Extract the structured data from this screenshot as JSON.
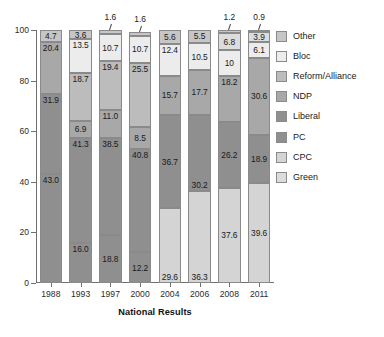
{
  "chart_data": {
    "type": "bar",
    "stacked": true,
    "title": "",
    "xlabel": "National Results",
    "ylabel": "",
    "ylim": [
      0,
      100
    ],
    "yticks": [
      0,
      20,
      40,
      60,
      80,
      100
    ],
    "grid": false,
    "legend_position": "right",
    "categories": [
      "1988",
      "1993",
      "1997",
      "2000",
      "2004",
      "2006",
      "2008",
      "2011"
    ],
    "series": [
      {
        "name": "PC",
        "color": "#8f8f8f",
        "values": [
          43.0,
          16.0,
          18.8,
          12.2,
          null,
          null,
          null,
          null
        ]
      },
      {
        "name": "CPC",
        "color": "#d4d4d4",
        "values": [
          null,
          null,
          null,
          null,
          29.6,
          36.3,
          37.6,
          39.6
        ]
      },
      {
        "name": "Liberal",
        "color": "#8f8f8f",
        "values": [
          31.9,
          41.3,
          38.5,
          40.8,
          36.7,
          30.2,
          26.2,
          18.9
        ]
      },
      {
        "name": "NDP",
        "color": "#a8a8a8",
        "values": [
          20.4,
          6.9,
          11.0,
          8.5,
          15.7,
          17.7,
          18.2,
          30.6
        ]
      },
      {
        "name": "Reform/Alliance",
        "color": "#bcbcbc",
        "values": [
          null,
          18.7,
          19.4,
          25.5,
          null,
          null,
          null,
          null
        ]
      },
      {
        "name": "Bloc",
        "color": "#ececec",
        "values": [
          null,
          13.5,
          10.7,
          10.7,
          12.4,
          10.5,
          10,
          6.1
        ]
      },
      {
        "name": "Green",
        "color": "#dcdcdc",
        "values": [
          null,
          null,
          null,
          null,
          null,
          null,
          6.8,
          3.9
        ]
      },
      {
        "name": "Other",
        "color": "#c6c6c6",
        "values": [
          4.7,
          3.6,
          1.6,
          1.6,
          5.6,
          5.5,
          1.2,
          0.9
        ]
      }
    ],
    "bars": [
      {
        "year": "1988",
        "segments": [
          {
            "series": "PC",
            "value": 43.0,
            "label": "43.0",
            "color": "#8f8f8f",
            "label_pos": "top"
          },
          {
            "series": "Liberal",
            "value": 31.9,
            "label": "31.9",
            "color": "#8f8f8f",
            "label_pos": "top"
          },
          {
            "series": "NDP",
            "value": 20.4,
            "label": "20.4",
            "color": "#a8a8a8",
            "label_pos": "top"
          },
          {
            "series": "Other",
            "value": 4.7,
            "label": "4.7",
            "color": "#c6c6c6",
            "label_pos": "mid"
          }
        ]
      },
      {
        "year": "1993",
        "segments": [
          {
            "series": "PC",
            "value": 16.0,
            "label": "16.0",
            "color": "#8f8f8f",
            "label_pos": "top"
          },
          {
            "series": "Liberal",
            "value": 41.3,
            "label": "41.3",
            "color": "#8f8f8f",
            "label_pos": "top"
          },
          {
            "series": "NDP",
            "value": 6.9,
            "label": "6.9",
            "color": "#a8a8a8",
            "label_pos": "mid"
          },
          {
            "series": "Reform/Alliance",
            "value": 18.7,
            "label": "18.7",
            "color": "#bcbcbc",
            "label_pos": "top"
          },
          {
            "series": "Bloc",
            "value": 13.5,
            "label": "13.5",
            "color": "#ececec",
            "label_pos": "top"
          },
          {
            "series": "Other",
            "value": 3.6,
            "label": "3.6",
            "color": "#c6c6c6",
            "label_pos": "mid"
          }
        ]
      },
      {
        "year": "1997",
        "segments": [
          {
            "series": "PC",
            "value": 18.8,
            "label": "18.8",
            "color": "#8f8f8f",
            "label_pos": "mid"
          },
          {
            "series": "Liberal",
            "value": 38.5,
            "label": "38.5",
            "color": "#8f8f8f",
            "label_pos": "top"
          },
          {
            "series": "NDP",
            "value": 11.0,
            "label": "11.0",
            "color": "#a8a8a8",
            "label_pos": "top"
          },
          {
            "series": "Reform/Alliance",
            "value": 19.4,
            "label": "19.4",
            "color": "#bcbcbc",
            "label_pos": "top"
          },
          {
            "series": "Bloc",
            "value": 10.7,
            "label": "10.7",
            "color": "#ececec",
            "label_pos": "mid"
          },
          {
            "series": "Other",
            "value": 1.6,
            "label": "1.6",
            "color": "#c6c6c6",
            "label_pos": "callout"
          }
        ]
      },
      {
        "year": "2000",
        "segments": [
          {
            "series": "PC",
            "value": 12.2,
            "label": "12.2",
            "color": "#8f8f8f",
            "label_pos": "mid"
          },
          {
            "series": "Liberal",
            "value": 40.8,
            "label": "40.8",
            "color": "#8f8f8f",
            "label_pos": "top"
          },
          {
            "series": "NDP",
            "value": 8.5,
            "label": "8.5",
            "color": "#a8a8a8",
            "label_pos": "mid"
          },
          {
            "series": "Reform/Alliance",
            "value": 25.5,
            "label": "25.5",
            "color": "#bcbcbc",
            "label_pos": "top"
          },
          {
            "series": "Bloc",
            "value": 10.7,
            "label": "10.7",
            "color": "#ececec",
            "label_pos": "mid"
          },
          {
            "series": "Other",
            "value": 1.6,
            "label": "1.6",
            "color": "#c6c6c6",
            "label_pos": "callout"
          }
        ]
      },
      {
        "year": "2004",
        "segments": [
          {
            "series": "CPC",
            "value": 29.6,
            "label": "29.6",
            "color": "#d4d4d4",
            "label_pos": "bottom"
          },
          {
            "series": "Liberal",
            "value": 36.7,
            "label": "36.7",
            "color": "#8f8f8f",
            "label_pos": "mid"
          },
          {
            "series": "NDP",
            "value": 15.7,
            "label": "15.7",
            "color": "#a8a8a8",
            "label_pos": "mid"
          },
          {
            "series": "Bloc",
            "value": 12.4,
            "label": "12.4",
            "color": "#ececec",
            "label_pos": "top"
          },
          {
            "series": "Other",
            "value": 5.6,
            "label": "5.6",
            "color": "#c6c6c6",
            "label_pos": "mid"
          }
        ]
      },
      {
        "year": "2006",
        "segments": [
          {
            "series": "CPC",
            "value": 36.3,
            "label": "36.3",
            "color": "#d4d4d4",
            "label_pos": "bottom"
          },
          {
            "series": "Liberal",
            "value": 30.2,
            "label": "30.2",
            "color": "#8f8f8f",
            "label_pos": "bottom"
          },
          {
            "series": "NDP",
            "value": 17.7,
            "label": "17.7",
            "color": "#a8a8a8",
            "label_pos": "mid"
          },
          {
            "series": "Bloc",
            "value": 10.5,
            "label": "10.5",
            "color": "#ececec",
            "label_pos": "mid"
          },
          {
            "series": "Other",
            "value": 5.5,
            "label": "5.5",
            "color": "#c6c6c6",
            "label_pos": "mid"
          }
        ]
      },
      {
        "year": "2008",
        "segments": [
          {
            "series": "CPC",
            "value": 37.6,
            "label": "37.6",
            "color": "#d4d4d4",
            "label_pos": "mid"
          },
          {
            "series": "Liberal",
            "value": 26.2,
            "label": "26.2",
            "color": "#8f8f8f",
            "label_pos": "mid"
          },
          {
            "series": "NDP",
            "value": 18.2,
            "label": "18.2",
            "color": "#a8a8a8",
            "label_pos": "top"
          },
          {
            "series": "Bloc",
            "value": 10,
            "label": "10",
            "color": "#ececec",
            "label_pos": "mid"
          },
          {
            "series": "Green",
            "value": 6.8,
            "label": "6.8",
            "color": "#dcdcdc",
            "label_pos": "mid"
          },
          {
            "series": "Other",
            "value": 1.2,
            "label": "1.2",
            "color": "#c6c6c6",
            "label_pos": "callout"
          }
        ]
      },
      {
        "year": "2011",
        "segments": [
          {
            "series": "CPC",
            "value": 39.6,
            "label": "39.6",
            "color": "#d4d4d4",
            "label_pos": "mid"
          },
          {
            "series": "Liberal",
            "value": 18.9,
            "label": "18.9",
            "color": "#8f8f8f",
            "label_pos": "mid"
          },
          {
            "series": "NDP",
            "value": 30.6,
            "label": "30.6",
            "color": "#a8a8a8",
            "label_pos": "mid"
          },
          {
            "series": "Bloc",
            "value": 6.1,
            "label": "6.1",
            "color": "#ececec",
            "label_pos": "mid"
          },
          {
            "series": "Green",
            "value": 3.9,
            "label": "3.9",
            "color": "#dcdcdc",
            "label_pos": "mid"
          },
          {
            "series": "Other",
            "value": 0.9,
            "label": "0.9",
            "color": "#c6c6c6",
            "label_pos": "callout"
          }
        ]
      }
    ]
  },
  "legend": {
    "items": [
      {
        "label": "Other",
        "color": "#c6c6c6"
      },
      {
        "label": "Bloc",
        "color": "#ececec"
      },
      {
        "label": "Reform/Alliance",
        "color": "#bcbcbc"
      },
      {
        "label": "NDP",
        "color": "#a8a8a8"
      },
      {
        "label": "Liberal",
        "color": "#8f8f8f"
      },
      {
        "label": "PC",
        "color": "#8f8f8f"
      },
      {
        "label": "CPC",
        "color": "#d4d4d4"
      },
      {
        "label": "Green",
        "color": "#dcdcdc"
      }
    ]
  }
}
